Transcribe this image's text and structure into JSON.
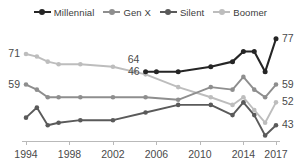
{
  "legend": {
    "items": [
      {
        "label": "Millennial",
        "color": "#252525",
        "icon": "line-marker-icon"
      },
      {
        "label": "Gen X",
        "color": "#8e8e8e",
        "icon": "line-marker-icon"
      },
      {
        "label": "Silent",
        "color": "#5a5a5a",
        "icon": "line-marker-icon"
      },
      {
        "label": "Boomer",
        "color": "#bdbdbd",
        "icon": "line-marker-icon"
      }
    ]
  },
  "axis": {
    "x_ticks": [
      "1994",
      "1998",
      "2002",
      "2006",
      "2010",
      "2014",
      "2017"
    ],
    "x_tick_years": [
      1994,
      1998,
      2002,
      2006,
      2010,
      2014,
      2017
    ],
    "x_min": 1994,
    "x_max": 2017,
    "y_min": 38,
    "y_max": 82,
    "grid": false
  },
  "endpoint_labels": {
    "left": [
      {
        "value": "71",
        "series": "Boomer"
      },
      {
        "value": "59",
        "series": "Gen X"
      },
      {
        "value": "46",
        "series": "Millennial"
      }
    ],
    "right": [
      {
        "value": "77",
        "series": "Millennial"
      },
      {
        "value": "59",
        "series": "Gen X"
      },
      {
        "value": "52",
        "series": "Boomer"
      },
      {
        "value": "43",
        "series": "Silent"
      }
    ]
  },
  "annotations": [
    {
      "text": "64",
      "series": "Boomer",
      "year": 2004,
      "value": 64
    }
  ],
  "chart_data": {
    "type": "line",
    "title": "",
    "subtitle": "",
    "xlabel": "",
    "ylabel": "",
    "xlim": [
      1994,
      2017
    ],
    "ylim": [
      38,
      82
    ],
    "grid": false,
    "legend_position": "top-center",
    "x": [
      1994,
      1995,
      1996,
      1997,
      1999,
      2002,
      2005,
      2006,
      2008,
      2011,
      2013,
      2014,
      2015,
      2016,
      2017
    ],
    "series": [
      {
        "name": "Millennial",
        "color": "#252525",
        "x": [
          2005,
          2006,
          2008,
          2011,
          2013,
          2014,
          2015,
          2016,
          2017
        ],
        "values": [
          64,
          64,
          64,
          66,
          68,
          72,
          72,
          64,
          77
        ]
      },
      {
        "name": "Gen X",
        "color": "#8e8e8e",
        "x": [
          1994,
          1995,
          1996,
          1997,
          1999,
          2002,
          2005,
          2008,
          2011,
          2013,
          2014,
          2015,
          2016,
          2017
        ],
        "values": [
          59,
          57,
          54,
          54,
          54,
          54,
          54,
          53,
          58,
          57,
          62,
          57,
          54,
          59
        ]
      },
      {
        "name": "Silent",
        "color": "#5a5a5a",
        "x": [
          1994,
          1995,
          1996,
          1997,
          1999,
          2002,
          2005,
          2008,
          2011,
          2013,
          2014,
          2015,
          2016,
          2017
        ],
        "values": [
          46,
          50,
          43,
          44,
          45,
          45,
          48,
          51,
          51,
          47,
          52,
          47,
          39,
          43
        ]
      },
      {
        "name": "Boomer",
        "color": "#bdbdbd",
        "x": [
          1994,
          1995,
          1996,
          1997,
          1999,
          2002,
          2004,
          2005,
          2008,
          2011,
          2013,
          2014,
          2015,
          2016,
          2017
        ],
        "values": [
          71,
          70,
          68,
          67,
          67,
          66,
          64,
          63,
          58,
          54,
          51,
          54,
          49,
          44,
          52
        ]
      }
    ]
  }
}
